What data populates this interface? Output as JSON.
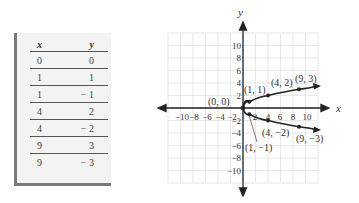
{
  "table": {
    "headers": [
      "x",
      "y"
    ],
    "rows": [
      [
        "0",
        "0"
      ],
      [
        "1",
        "1"
      ],
      [
        "1",
        "− 1"
      ],
      [
        "4",
        "2"
      ],
      [
        "4",
        "− 2"
      ],
      [
        "9",
        "3"
      ],
      [
        "9",
        "− 3"
      ]
    ]
  },
  "chart_data": {
    "type": "line",
    "title": "",
    "xlabel": "x",
    "ylabel": "y",
    "xlim": [
      -12,
      12
    ],
    "ylim": [
      -12,
      12
    ],
    "grid": true,
    "x_ticks": [
      -10,
      -8,
      -6,
      -4,
      -2,
      2,
      4,
      6,
      8,
      10
    ],
    "y_ticks": [
      -10,
      -8,
      -6,
      -4,
      -2,
      2,
      4,
      6,
      8,
      10
    ],
    "x_tick_labels": [
      "−10",
      "−8",
      "−6",
      "−4",
      "−2",
      "2",
      "4",
      "6",
      "8",
      "10"
    ],
    "y_tick_labels": [
      "−10",
      "−8",
      "−6",
      "−4",
      "−2",
      "2",
      "4",
      "6",
      "8",
      "10"
    ],
    "series": [
      {
        "name": "upper branch",
        "x": [
          0,
          1,
          4,
          9
        ],
        "y": [
          0,
          1,
          2,
          3
        ]
      },
      {
        "name": "lower branch",
        "x": [
          0,
          1,
          4,
          9
        ],
        "y": [
          0,
          -1,
          -2,
          -3
        ]
      }
    ],
    "annotations": [
      "(0, 0)",
      "(1, 1)",
      "(4, 2)",
      "(9, 3)",
      "(1, −1)",
      "(4, −2)",
      "(9, −3)"
    ]
  }
}
